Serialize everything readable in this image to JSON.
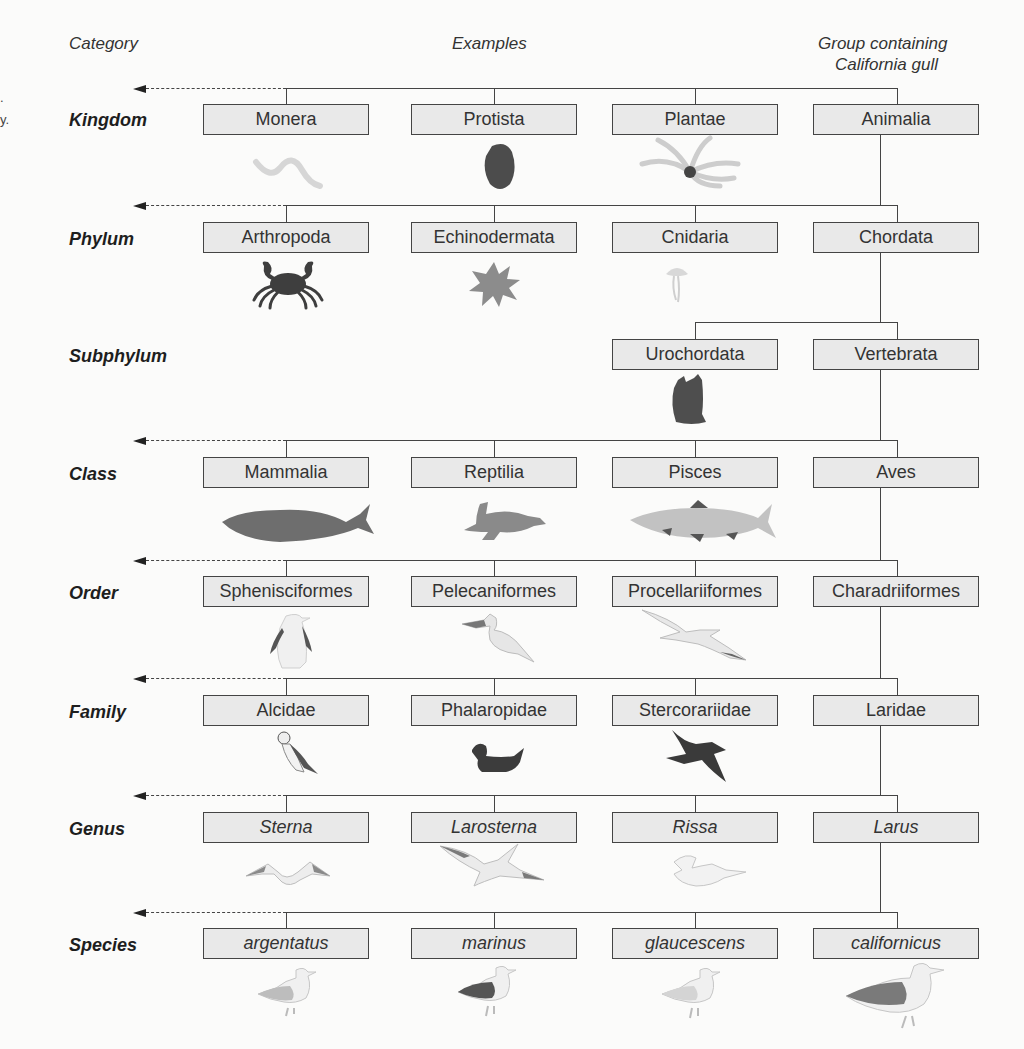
{
  "headers": {
    "category": "Category",
    "examples": "Examples",
    "group_line1": "Group containing",
    "group_line2": "California gull"
  },
  "cropped_caption_fragments": [
    ".",
    "y."
  ],
  "ranks": [
    {
      "category": "Kingdom",
      "taxa": [
        "Monera",
        "Protista",
        "Plantae",
        "Animalia"
      ],
      "italic": false,
      "illustrations": [
        "bacterium-icon",
        "protist-icon",
        "seaweed-icon",
        ""
      ]
    },
    {
      "category": "Phylum",
      "taxa": [
        "Arthropoda",
        "Echinodermata",
        "Cnidaria",
        "Chordata"
      ],
      "italic": false,
      "illustrations": [
        "crab-icon",
        "sea-star-icon",
        "jellyfish-icon",
        ""
      ]
    },
    {
      "category": "Subphylum",
      "taxa": [
        "",
        "",
        "Urochordata",
        "Vertebrata"
      ],
      "italic": false,
      "illustrations": [
        "",
        "",
        "sea-squirt-icon",
        ""
      ]
    },
    {
      "category": "Class",
      "taxa": [
        "Mammalia",
        "Reptilia",
        "Pisces",
        "Aves"
      ],
      "italic": false,
      "illustrations": [
        "whale-icon",
        "sea-turtle-icon",
        "fish-icon",
        ""
      ]
    },
    {
      "category": "Order",
      "taxa": [
        "Sphenisciformes",
        "Pelecaniformes",
        "Procellariiformes",
        "Charadriiformes"
      ],
      "italic": false,
      "illustrations": [
        "penguin-icon",
        "pelican-icon",
        "albatross-icon",
        ""
      ]
    },
    {
      "category": "Family",
      "taxa": [
        "Alcidae",
        "Phalaropidae",
        "Stercorariidae",
        "Laridae"
      ],
      "italic": false,
      "illustrations": [
        "puffin-icon",
        "phalarope-icon",
        "skua-icon",
        ""
      ]
    },
    {
      "category": "Genus",
      "taxa": [
        "Sterna",
        "Larosterna",
        "Rissa",
        "Larus"
      ],
      "italic": true,
      "illustrations": [
        "tern-icon",
        "inca-tern-icon",
        "kittiwake-icon",
        ""
      ]
    },
    {
      "category": "Species",
      "taxa": [
        "argentatus",
        "marinus",
        "glaucescens",
        "californicus"
      ],
      "italic": true,
      "illustrations": [
        "herring-gull-icon",
        "black-backed-gull-icon",
        "glaucous-winged-gull-icon",
        "california-gull-icon"
      ]
    }
  ],
  "colors": {
    "box_fill": "#e9e9e9",
    "line": "#444444",
    "dark_silhouette": "#4a4a4a",
    "mid_silhouette": "#8a8a8a",
    "light_silhouette": "#cfcfcf"
  }
}
